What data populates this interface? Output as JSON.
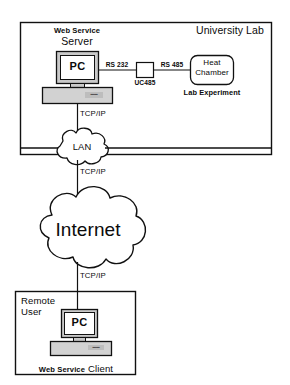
{
  "diagram": {
    "type": "network-architecture-diagram"
  },
  "lab": {
    "title": "University Lab",
    "server": {
      "caption_small": "Web Service",
      "caption_large": "Server",
      "screen_label": "PC",
      "keyboard_logo": "keyboard"
    },
    "links": {
      "rs232": "RS 232",
      "rs485": "RS 485"
    },
    "converter": {
      "label": "UC485"
    },
    "experiment": {
      "line1": "Heat",
      "line2": "Chamber",
      "caption": "Lab Experiment"
    }
  },
  "network": {
    "tcpip_server_to_lan": "TCP/IP",
    "tcpip_lan_to_internet": "TCP/IP",
    "tcpip_internet_to_client": "TCP/IP",
    "lan_label": "LAN",
    "internet_label": "Internet"
  },
  "remote": {
    "title_line1": "Remote",
    "title_line2": "User",
    "client": {
      "screen_label": "PC",
      "keyboard_logo": "keyboard",
      "caption_small": "Web Service",
      "caption_large": "Client"
    }
  },
  "colors": {
    "stroke": "#111111",
    "background": "#ffffff",
    "device_fill": "#c9c9c9",
    "screen_fill": "#ffffff",
    "keyboard_fill": "#d2d2d2"
  }
}
